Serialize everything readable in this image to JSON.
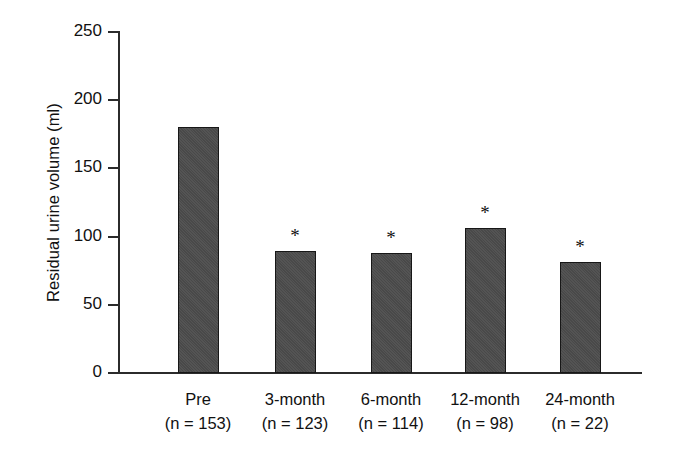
{
  "chart_data": {
    "type": "bar",
    "title": "",
    "subtitle": "",
    "xlabel": "",
    "ylabel": "Residual urine volume (ml)",
    "ylim": [
      0,
      250
    ],
    "yticks": [
      0,
      50,
      100,
      150,
      200,
      250
    ],
    "ytick_labels": [
      "0",
      "50",
      "100",
      "150",
      "200",
      "250"
    ],
    "grid": false,
    "legend": null,
    "categories": [
      "Pre",
      "3-month",
      "6-month",
      "12-month",
      "24-month"
    ],
    "category_sublabels": [
      "(n = 153)",
      "(n = 123)",
      "(n = 114)",
      "(n = 98)",
      "(n = 22)"
    ],
    "group_sizes": [
      153,
      123,
      114,
      98,
      22
    ],
    "values": [
      180,
      89,
      88,
      106,
      81
    ],
    "annotations": [
      {
        "category": "3-month",
        "symbol": "*"
      },
      {
        "category": "6-month",
        "symbol": "*"
      },
      {
        "category": "12-month",
        "symbol": "*"
      },
      {
        "category": "24-month",
        "symbol": "*"
      }
    ],
    "bar_color": "#4c4c4c",
    "bar_edge_color": "#171717",
    "axis_color": "#2b2b2b",
    "background_color": "#ffffff"
  },
  "bars": [
    {
      "label": "Pre",
      "sublabel": "(n = 153)",
      "value": 180,
      "star": ""
    },
    {
      "label": "3-month",
      "sublabel": "(n = 123)",
      "value": 89,
      "star": "*"
    },
    {
      "label": "6-month",
      "sublabel": "(n = 114)",
      "value": 88,
      "star": "*"
    },
    {
      "label": "12-month",
      "sublabel": "(n = 98)",
      "value": 106,
      "star": "*"
    },
    {
      "label": "24-month",
      "sublabel": "(n = 22)",
      "value": 81,
      "star": "*"
    }
  ],
  "yticks": [
    {
      "label": "250"
    },
    {
      "label": "200"
    },
    {
      "label": "150"
    },
    {
      "label": "100"
    },
    {
      "label": "50"
    },
    {
      "label": "0"
    }
  ]
}
